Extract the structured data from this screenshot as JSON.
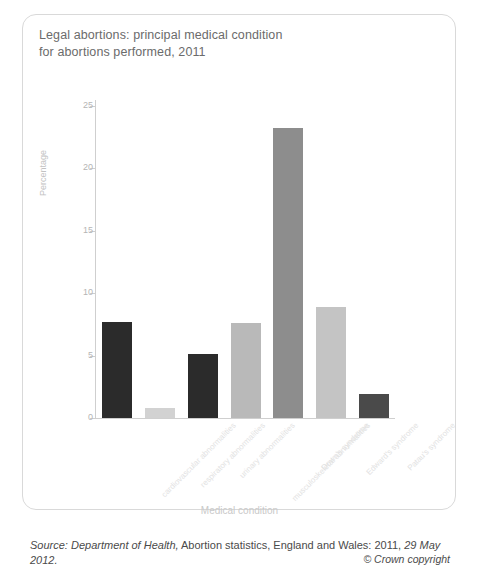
{
  "card": {
    "title_line1": "Legal abortions: principal medical condition",
    "title_line2": "for abortions performed, 2011"
  },
  "footer": {
    "source_prefix": "Source: Department of Health,",
    "source_mid": " Abortion statistics, England and Wales: 2011, ",
    "source_date": "29 May 2012.",
    "copyright": "© Crown copyright"
  },
  "chart_data": {
    "type": "bar",
    "title": "Legal abortions: principal medical condition for abortions performed, 2011",
    "xlabel": "Medical condition",
    "ylabel": "Percentage",
    "ylim": [
      0,
      25
    ],
    "yticks": [
      0,
      5,
      10,
      15,
      20,
      25
    ],
    "ytick_labels": [
      "0",
      "5",
      "10",
      "15",
      "20",
      "25"
    ],
    "grid": false,
    "legend": "none",
    "categories": [
      "cardiovascular abnormalities",
      "respiratory abnormalities",
      "urinary abnormalities",
      "musculoskeletal abnormalities",
      "Down's syndrome",
      "Edward's syndrome",
      "Patau's syndrome"
    ],
    "values": [
      7.7,
      0.8,
      5.1,
      7.6,
      23.2,
      8.9,
      1.9
    ],
    "bar_colors": [
      "#2b2b2b",
      "#d2d2d2",
      "#2b2b2b",
      "#b9b9b9",
      "#8d8d8d",
      "#c4c4c4",
      "#4a4a4a"
    ],
    "axis_color": "#cfcfcf",
    "tick_label_color": "#b5b5b5",
    "axis_title_color": "#c9c9c9"
  }
}
